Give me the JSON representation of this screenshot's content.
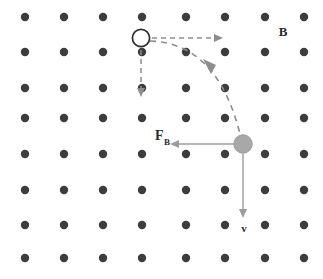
{
  "figure": {
    "canvas": {
      "width": 323,
      "height": 279,
      "background": "#ffffff"
    },
    "labels": {
      "magnetic_field": "B",
      "force_main": "F",
      "force_subscript": "B",
      "velocity": "v"
    },
    "colors": {
      "field_dot": "#3d3d3d",
      "start_particle_fill": "#ffffff",
      "start_particle_stroke": "#2f2f2f",
      "end_particle_fill": "#a8a8a8",
      "dashed_path": "#8d8d8d",
      "solid_vector": "#9c9c9c",
      "text": "#2b2b2b"
    },
    "field_grid": {
      "symbol": "dot-out-of-page",
      "columns_x": [
        25,
        64,
        103,
        142,
        186,
        225,
        265,
        304
      ],
      "rows_y": [
        17,
        52,
        88,
        118,
        154,
        190,
        225,
        258
      ],
      "dot_radius": 4.2,
      "count": 64
    },
    "particles": [
      {
        "name": "start-particle",
        "style": "open-circle",
        "cx": 141,
        "cy": 38,
        "r": 8.6
      },
      {
        "name": "end-particle",
        "style": "filled-gray-circle",
        "cx": 243,
        "cy": 144,
        "r": 9.2
      }
    ],
    "vectors": [
      {
        "name": "initial-velocity-horizontal",
        "style": "dashed",
        "x1": 152,
        "y1": 38,
        "x2": 220,
        "y2": 38,
        "direction": "right"
      },
      {
        "name": "initial-velocity-vertical",
        "style": "dashed",
        "x1": 141,
        "y1": 50,
        "x2": 141,
        "y2": 94,
        "direction": "down"
      },
      {
        "name": "magnetic-force-vector",
        "style": "solid",
        "x1": 234,
        "y1": 144,
        "x2": 171,
        "y2": 144,
        "direction": "left"
      },
      {
        "name": "velocity-vector",
        "style": "solid",
        "x1": 243,
        "y1": 154,
        "x2": 243,
        "y2": 216,
        "direction": "down"
      }
    ],
    "trajectory": {
      "name": "curved-particle-path",
      "style": "dashed-arc",
      "start": [
        150,
        41
      ],
      "control": [
        215,
        50
      ],
      "end": [
        240,
        134
      ],
      "arrow_at": [
        211,
        69
      ],
      "arrow_angle_deg": 55
    },
    "label_positions": {
      "magnetic_field": [
        283,
        36
      ],
      "force": [
        155,
        140
      ],
      "velocity": [
        244,
        231
      ]
    }
  }
}
